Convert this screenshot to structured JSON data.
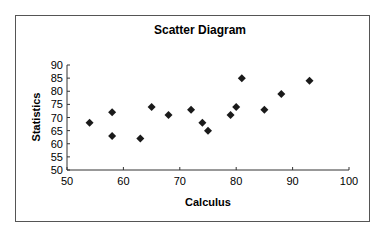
{
  "chart_data": {
    "type": "scatter",
    "title": "Scatter Diagram",
    "xlabel": "Calculus",
    "ylabel": "Statistics",
    "xlim": [
      50,
      100
    ],
    "ylim": [
      50,
      90
    ],
    "xticks": [
      50,
      60,
      70,
      80,
      90,
      100
    ],
    "yticks": [
      50,
      55,
      60,
      65,
      70,
      75,
      80,
      85,
      90
    ],
    "grid": false,
    "legend": null,
    "marker": "diamond",
    "marker_color": "#1a1a1a",
    "points": [
      {
        "x": 54,
        "y": 68
      },
      {
        "x": 58,
        "y": 72
      },
      {
        "x": 58,
        "y": 63
      },
      {
        "x": 63,
        "y": 62
      },
      {
        "x": 65,
        "y": 74
      },
      {
        "x": 68,
        "y": 71
      },
      {
        "x": 72,
        "y": 73
      },
      {
        "x": 74,
        "y": 68
      },
      {
        "x": 75,
        "y": 65
      },
      {
        "x": 79,
        "y": 71
      },
      {
        "x": 80,
        "y": 74
      },
      {
        "x": 81,
        "y": 85
      },
      {
        "x": 85,
        "y": 73
      },
      {
        "x": 88,
        "y": 79
      },
      {
        "x": 93,
        "y": 84
      }
    ]
  }
}
